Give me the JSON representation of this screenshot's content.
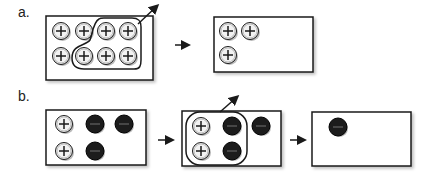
{
  "panels": {
    "a": {
      "label": "a.",
      "boxes": [
        {
          "id": "a1",
          "x": 46,
          "y": 16,
          "w": 107,
          "h": 64,
          "particles": [
            {
              "cx": 61,
              "cy": 31,
              "charge": "+"
            },
            {
              "cx": 84,
              "cy": 31,
              "charge": "+"
            },
            {
              "cx": 106,
              "cy": 31,
              "charge": "+"
            },
            {
              "cx": 128,
              "cy": 31,
              "charge": "+"
            },
            {
              "cx": 61,
              "cy": 56,
              "charge": "+"
            },
            {
              "cx": 84,
              "cy": 56,
              "charge": "+"
            },
            {
              "cx": 106,
              "cy": 56,
              "charge": "+"
            },
            {
              "cx": 128,
              "cy": 56,
              "charge": "+"
            }
          ],
          "selection": "lasso around 5 right-hand positive particles, leaving the box"
        },
        {
          "id": "a2",
          "x": 214,
          "y": 17,
          "w": 99,
          "h": 55,
          "particles": [
            {
              "cx": 228,
              "cy": 31,
              "charge": "+"
            },
            {
              "cx": 250,
              "cy": 31,
              "charge": "+"
            },
            {
              "cx": 228,
              "cy": 55,
              "charge": "+"
            }
          ]
        }
      ],
      "arrows": [
        {
          "x1": 175,
          "y1": 45,
          "x2": 188,
          "y2": 45
        }
      ]
    },
    "b": {
      "label": "b.",
      "boxes": [
        {
          "id": "b1",
          "x": 46,
          "y": 110,
          "w": 100,
          "h": 55,
          "particles": [
            {
              "cx": 64,
              "cy": 124,
              "charge": "+"
            },
            {
              "cx": 95,
              "cy": 124,
              "charge": "-"
            },
            {
              "cx": 124,
              "cy": 124,
              "charge": "-"
            },
            {
              "cx": 64,
              "cy": 151,
              "charge": "+"
            },
            {
              "cx": 95,
              "cy": 151,
              "charge": "-"
            }
          ]
        },
        {
          "id": "b2",
          "x": 182,
          "y": 111,
          "w": 99,
          "h": 55,
          "particles": [
            {
              "cx": 201,
              "cy": 126,
              "charge": "+"
            },
            {
              "cx": 232,
              "cy": 126,
              "charge": "-"
            },
            {
              "cx": 261,
              "cy": 126,
              "charge": "-"
            },
            {
              "cx": 201,
              "cy": 151,
              "charge": "+"
            },
            {
              "cx": 232,
              "cy": 151,
              "charge": "-"
            }
          ],
          "selection": "rounded lasso around 2 positive and 2 negative particles, leaving the box"
        },
        {
          "id": "b3",
          "x": 312,
          "y": 112,
          "w": 99,
          "h": 54,
          "particles": [
            {
              "cx": 338,
              "cy": 127,
              "charge": "-"
            }
          ]
        }
      ],
      "arrows": [
        {
          "x1": 158,
          "y1": 140,
          "x2": 172,
          "y2": 140
        },
        {
          "x1": 290,
          "y1": 140,
          "x2": 304,
          "y2": 140
        }
      ]
    }
  },
  "colors": {
    "outline": "#1a1a1a",
    "positive_fill": "#f2f2f2",
    "negative_fill": "#1c1c1c",
    "shadow": "#b8b8b8"
  }
}
